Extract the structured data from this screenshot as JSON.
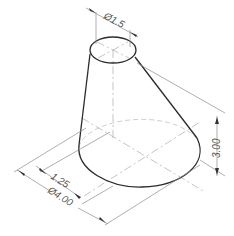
{
  "figure": {
    "colors": {
      "object_line": "#2b2b2b",
      "dimension_line": "#8c8c8c",
      "center_line": "#b5b5b5",
      "text": "#555555",
      "background": "#ffffff"
    },
    "dimensions": {
      "top_diameter": "Ø1.5",
      "height": "3.00",
      "offset": "1.25",
      "base_diameter": "Ø4.00"
    }
  }
}
